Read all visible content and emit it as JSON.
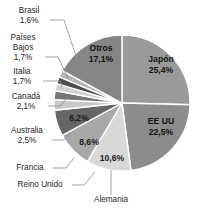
{
  "chart_data": {
    "type": "pie",
    "title": "",
    "subtitle": "",
    "xlabel": "",
    "ylabel": "",
    "legend_position": "callout-labels",
    "grid": false,
    "units": "%",
    "decimal_separator": ",",
    "start_angle_deg": -90,
    "direction": "clockwise",
    "categories": [
      "Japón",
      "EE UU",
      "Alemania",
      "Reino Unido",
      "Francia",
      "Australia",
      "Canadá",
      "Italia",
      "Países Bajos",
      "Brasil",
      "Otros"
    ],
    "values": [
      25.4,
      22.5,
      10.6,
      8.6,
      6.2,
      2.5,
      2.1,
      1.7,
      1.7,
      1.6,
      17.1
    ],
    "slices": [
      {
        "name": "Japón",
        "label": "Japón",
        "value_text": "25,4%",
        "value": 25.4,
        "color": "#9a9a9a",
        "label_mode": "inside",
        "label_x": 160,
        "label_y": 62,
        "pct_x": 160,
        "pct_y": 72
      },
      {
        "name": "EE UU",
        "label": "EE UU",
        "value_text": "22,5%",
        "value": 22.5,
        "color": "#8c8c8c",
        "label_mode": "inside",
        "label_x": 161,
        "label_y": 122,
        "pct_x": 161,
        "pct_y": 132
      },
      {
        "name": "Alemania",
        "label": "Alemania",
        "value_text": "10,6%",
        "value": 10.6,
        "color": "#d8d8d8",
        "label_mode": "outside-bottom",
        "label_x": 111,
        "label_y": 200,
        "pct_x": 110,
        "pct_y": 157
      },
      {
        "name": "Reino Unido",
        "label": "Reino Unido",
        "value_text": "8,6%",
        "value": 8.6,
        "color": "#a8a8a8",
        "label_mode": "outside-left",
        "label_x": 40,
        "label_y": 185,
        "pct_x": 88,
        "pct_y": 143
      },
      {
        "name": "Francia",
        "label": "Francia",
        "value_text": "6,2%",
        "value": 6.2,
        "color": "#666666",
        "label_mode": "outside-left",
        "label_x": 30,
        "label_y": 168,
        "pct_x": 80,
        "pct_y": 119
      },
      {
        "name": "Australia",
        "label": "Australia",
        "value_text": "2,5%",
        "value": 2.5,
        "color": "#c8c8c8",
        "label_mode": "outside-left",
        "label_x": 27,
        "label_y": 141,
        "pct_x": 27,
        "pct_y": 151
      },
      {
        "name": "Canadá",
        "label": "Canadá",
        "value_text": "2,1%",
        "value": 2.1,
        "color": "#777777",
        "label_mode": "outside-left",
        "label_x": 26,
        "label_y": 106,
        "pct_x": 26,
        "pct_y": 116
      },
      {
        "name": "Italia",
        "label": "Italia",
        "value_text": "1,7%",
        "value": 1.7,
        "color": "#cfcfcf",
        "label_mode": "outside-left",
        "label_x": 22,
        "label_y": 72,
        "pct_x": 22,
        "pct_y": 82
      },
      {
        "name": "Países Bajos",
        "label": "Países Bajos",
        "value_text": "1,7%",
        "value": 1.7,
        "color": "#4d4d4d",
        "label_mode": "outside-left",
        "label_x": 22,
        "label_y": 38,
        "pct_x": 22,
        "pct_y": 58
      },
      {
        "name": "Brasil",
        "label": "Brasil",
        "value_text": "1,6%",
        "value": 1.6,
        "color": "#b5b5b5",
        "label_mode": "outside-left",
        "label_x": 29,
        "label_y": 11,
        "pct_x": 29,
        "pct_y": 21
      },
      {
        "name": "Otros",
        "label": "Otros",
        "value_text": "17,1%",
        "value": 17.1,
        "color": "#858585",
        "label_mode": "inside",
        "label_x": 100,
        "label_y": 48,
        "pct_x": 100,
        "pct_y": 58
      }
    ],
    "geometry": {
      "cx": 122,
      "cy": 103,
      "r": 68
    }
  },
  "labels": {
    "brasil_name": "Brasil",
    "brasil_pct": "1,6%",
    "paises_name_1": "Países",
    "paises_name_2": "Bajos",
    "paises_pct": "1,7%",
    "italia_name": "Italia",
    "italia_pct": "1,7%",
    "canada_name": "Canadá",
    "canada_pct": "2,1%",
    "australia_name": "Australia",
    "australia_pct": "2,5%",
    "francia_name": "Francia",
    "reino_unido_name": "Reino Unido",
    "alemania_name": "Alemania",
    "otros_name": "Otros",
    "otros_pct": "17,1%",
    "japon_name": "Japón",
    "japon_pct": "25,4%",
    "eeuu_name": "EE UU",
    "eeuu_pct": "22,5%",
    "francia_pct": "6,2%",
    "reino_unido_pct": "8,6%",
    "alemania_pct": "10,6%"
  }
}
